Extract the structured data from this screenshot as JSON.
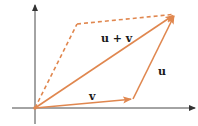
{
  "diagram": {
    "colors": {
      "vector": "#E0874F",
      "axis": "#333333",
      "label": "#1a1a1a"
    },
    "labels": {
      "sum": "u + v",
      "u": "u",
      "v": "v"
    },
    "elements": [
      {
        "id": "x-axis",
        "type": "axis",
        "from": [
          12,
          108
        ],
        "to": [
          196,
          108
        ]
      },
      {
        "id": "y-axis",
        "type": "axis",
        "from": [
          35,
          124
        ],
        "to": [
          35,
          4
        ]
      },
      {
        "id": "vector-v",
        "type": "arrow",
        "from": [
          35,
          108
        ],
        "to": [
          133,
          99
        ],
        "style": "solid"
      },
      {
        "id": "vector-u",
        "type": "arrow",
        "from": [
          133,
          99
        ],
        "to": [
          175,
          14
        ],
        "style": "solid"
      },
      {
        "id": "vector-u-plus-v",
        "type": "arrow",
        "from": [
          35,
          108
        ],
        "to": [
          175,
          14
        ],
        "style": "solid"
      },
      {
        "id": "dashed-u",
        "type": "line",
        "from": [
          35,
          108
        ],
        "to": [
          77,
          24
        ],
        "style": "dashed"
      },
      {
        "id": "dashed-v",
        "type": "line",
        "from": [
          77,
          24
        ],
        "to": [
          175,
          14
        ],
        "style": "dashed"
      }
    ]
  }
}
